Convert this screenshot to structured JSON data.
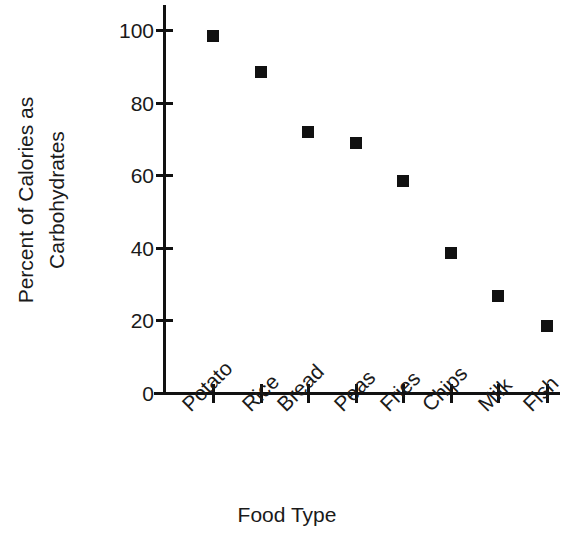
{
  "chart_data": {
    "type": "scatter",
    "title": "",
    "xlabel": "Food Type",
    "ylabel": "Percent of Calories as Carbohydrates",
    "ylabel_lines": [
      "Percent of Calories as",
      "Carbohydrates"
    ],
    "categories": [
      "Potato",
      "Rice",
      "Bread",
      "Peas",
      "Fries",
      "Chips",
      "Milk",
      "Fish"
    ],
    "values": [
      98.3,
      88.4,
      71.9,
      68.9,
      58.5,
      38.6,
      26.8,
      18.5
    ],
    "ylim": [
      0,
      100
    ],
    "yticks": [
      0,
      20,
      40,
      60,
      80,
      100
    ],
    "ytick_labels": [
      "0",
      "20",
      "40",
      "60",
      "80",
      "100"
    ],
    "grid": false,
    "legend": false,
    "marker": {
      "shape": "square",
      "color": "#111111",
      "size": 12
    },
    "axis_color": "#111111",
    "background": "#ffffff"
  },
  "axis_titles": {
    "x": "Food Type",
    "y_line1": "Percent of Calories as",
    "y_line2": "Carbohydrates"
  },
  "ytick_labels": {
    "t0": "0",
    "t1": "20",
    "t2": "40",
    "t3": "60",
    "t4": "80",
    "t5": "100"
  },
  "xtick_labels": {
    "c0": "Potato",
    "c1": "Rice",
    "c2": "Bread",
    "c3": "Peas",
    "c4": "Fries",
    "c5": "Chips",
    "c6": "Milk",
    "c7": "Fish"
  }
}
